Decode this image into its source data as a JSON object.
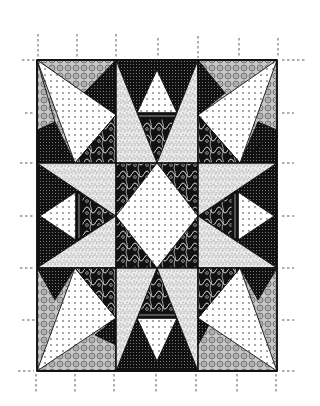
{
  "image": {
    "subject": "Eight-pointed star quilt pattern illustration",
    "style": "black and white line art with printed fabric textures",
    "width": 320,
    "height": 406
  },
  "quilt": {
    "bounds": {
      "x": 37,
      "y": 60,
      "width": 240,
      "height": 311
    },
    "columns": [
      37,
      116,
      198,
      277
    ],
    "rows": [
      60,
      163,
      268,
      371
    ],
    "blocks": [
      {
        "id": "top-left",
        "type": "corner-pinwheel"
      },
      {
        "id": "top-center",
        "type": "star-point-up"
      },
      {
        "id": "top-right",
        "type": "corner-pinwheel"
      },
      {
        "id": "middle-left",
        "type": "star-point-left"
      },
      {
        "id": "center",
        "type": "center-diamond"
      },
      {
        "id": "middle-right",
        "type": "star-point-right"
      },
      {
        "id": "bottom-left",
        "type": "corner-pinwheel"
      },
      {
        "id": "bottom-center",
        "type": "star-point-down"
      },
      {
        "id": "bottom-right",
        "type": "corner-pinwheel"
      }
    ],
    "fabrics": [
      "white-dotted",
      "dark-grid",
      "circle-print",
      "stipple-squiggle",
      "black-ornate"
    ]
  },
  "cut_marks": {
    "top_x": [
      38,
      77,
      116,
      158,
      198,
      239,
      278
    ],
    "bottom_x": [
      36,
      75,
      114,
      156,
      196,
      237,
      276
    ],
    "left_y": [
      60,
      113,
      163,
      216,
      268,
      320,
      371
    ],
    "right_y": [
      60,
      113,
      163,
      216,
      268,
      320,
      371
    ]
  },
  "colors": {
    "ink": "#111111",
    "paper": "#ffffff",
    "mid_gray": "#9a9a9a"
  }
}
